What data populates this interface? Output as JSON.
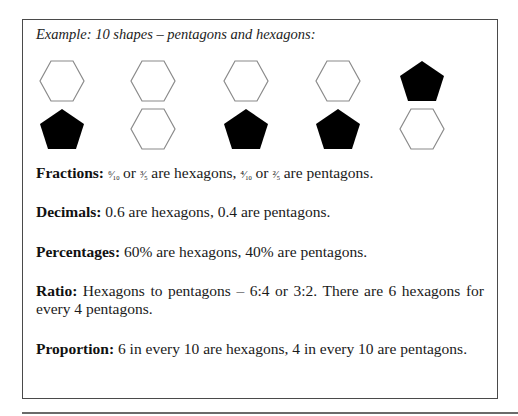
{
  "example": {
    "caption": "Example: 10 shapes – pentagons and hexagons:",
    "colors": {
      "hexagon_stroke": "#8a8a8a",
      "pentagon_fill": "#000000",
      "border": "#4a4a4a"
    },
    "shapes": [
      {
        "row": 1,
        "col": 1,
        "type": "hexagon",
        "style": "outline"
      },
      {
        "row": 1,
        "col": 2,
        "type": "hexagon",
        "style": "outline"
      },
      {
        "row": 1,
        "col": 3,
        "type": "hexagon",
        "style": "outline"
      },
      {
        "row": 1,
        "col": 4,
        "type": "hexagon",
        "style": "outline"
      },
      {
        "row": 1,
        "col": 5,
        "type": "pentagon",
        "style": "filled"
      },
      {
        "row": 2,
        "col": 1,
        "type": "pentagon",
        "style": "filled"
      },
      {
        "row": 2,
        "col": 2,
        "type": "hexagon",
        "style": "outline"
      },
      {
        "row": 2,
        "col": 3,
        "type": "pentagon",
        "style": "filled"
      },
      {
        "row": 2,
        "col": 4,
        "type": "pentagon",
        "style": "filled"
      },
      {
        "row": 2,
        "col": 5,
        "type": "hexagon",
        "style": "outline"
      }
    ]
  },
  "paragraphs": {
    "fractions": {
      "label": "Fractions:",
      "frac1": "⁶⁄₁₀",
      "or1": " or ",
      "frac2": "³⁄₅",
      "mid": " are hexagons, ",
      "frac3": "⁴⁄₁₀",
      "or2": " or ",
      "frac4": "²⁄₅",
      "end": " are pentagons."
    },
    "decimals": {
      "label": "Decimals:",
      "text": " 0.6 are hexagons, 0.4 are pentagons."
    },
    "percentages": {
      "label": "Percentages:",
      "text": " 60% are hexagons, 40% are pentagons."
    },
    "ratio": {
      "label": "Ratio:",
      "text": " Hexagons to pentagons – 6:4 or 3:2. There are 6 hexagons for every 4 pentagons."
    },
    "proportion": {
      "label": "Proportion:",
      "text": " 6 in every 10 are hexagons, 4 in every 10 are pentagons."
    }
  }
}
